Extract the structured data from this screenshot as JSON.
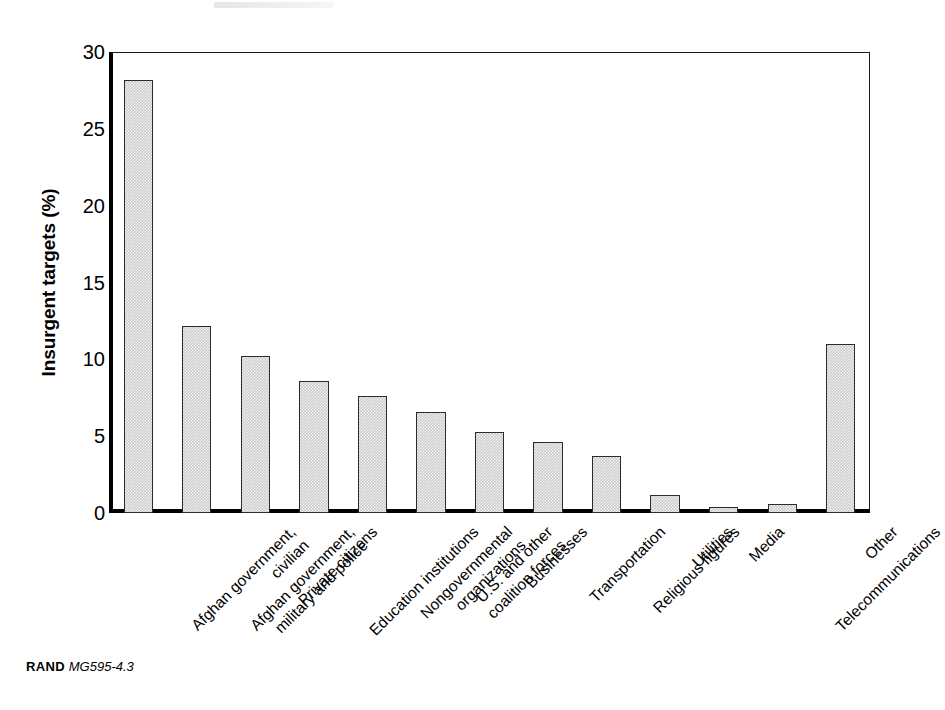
{
  "figure": {
    "footer_source": "RAND",
    "footer_code": "MG595-4.3"
  },
  "chart_data": {
    "type": "bar",
    "title": "",
    "subtitle": "",
    "xlabel": "",
    "ylabel": "Insurgent targets (%)",
    "ylim": [
      0,
      30
    ],
    "yticks": [
      0,
      5,
      10,
      15,
      20,
      25,
      30
    ],
    "ytick_labels": [
      "0",
      "5",
      "10",
      "15",
      "20",
      "25",
      "30"
    ],
    "grid": false,
    "legend": null,
    "bar_fill_color": "#cdcdcd",
    "bar_edge_color": "#2b2b2b",
    "axis_color": "#000000",
    "categories": [
      "Afghan government, civilian",
      "Afghan government, military and police",
      "Private citizens",
      "Education institutions",
      "Nongovernmental organizations",
      "U.S. and other coalition forces",
      "Businesses",
      "Transportation",
      "Religious figures",
      "Utilities",
      "Media",
      "Telecommunications",
      "Other"
    ],
    "category_lines": [
      [
        "Afghan government,",
        "civilian"
      ],
      [
        "Afghan government,",
        "military and police"
      ],
      [
        "Private citizens"
      ],
      [
        "Education institutions"
      ],
      [
        "Nongovernmental",
        "organizations"
      ],
      [
        "U.S. and other",
        "coalition forces"
      ],
      [
        "Businesses"
      ],
      [
        "Transportation"
      ],
      [
        "Religious figures"
      ],
      [
        "Utilities"
      ],
      [
        "Media"
      ],
      [
        "Telecommunications"
      ],
      [
        "Other"
      ]
    ],
    "values": [
      28.2,
      12.2,
      10.2,
      8.6,
      7.6,
      6.6,
      5.3,
      4.6,
      3.7,
      1.2,
      0.4,
      0.6,
      11.0
    ]
  }
}
